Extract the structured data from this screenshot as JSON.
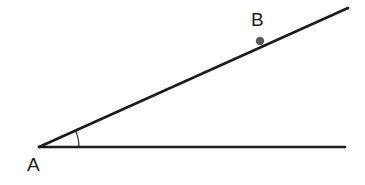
{
  "figure": {
    "type": "angle-diagram",
    "background_color": "#ffffff",
    "width": 365,
    "height": 185,
    "stroke_color": "#1c1c1c",
    "point_color": "#5a5a5a",
    "arc_color": "#1c1c1c"
  },
  "labels": {
    "vertex_a": "A",
    "point_b": "B"
  },
  "geometry": {
    "vertex": {
      "x": 39,
      "y": 147
    },
    "horizontal_ray_end": {
      "x": 345,
      "y": 147
    },
    "diagonal_ray_end": {
      "x": 348,
      "y": 8
    },
    "point_b": {
      "x": 260,
      "y": 41,
      "radius": 4
    },
    "arc_radius": 40,
    "angle_degrees": 24.5
  }
}
